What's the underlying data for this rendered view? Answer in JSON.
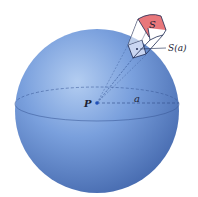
{
  "figure": {
    "labels": {
      "center": "P",
      "radius": "a",
      "surface": "S",
      "projected_surface": "S(a)"
    },
    "colors": {
      "sphere_light": "#a9c4ec",
      "sphere_mid": "#6e94d6",
      "sphere_dark": "#3e63a8",
      "surface_patch": "#e8777b",
      "small_patch": "#c9d6f2",
      "outline": "#1d2a52",
      "background": "#ffffff"
    }
  }
}
